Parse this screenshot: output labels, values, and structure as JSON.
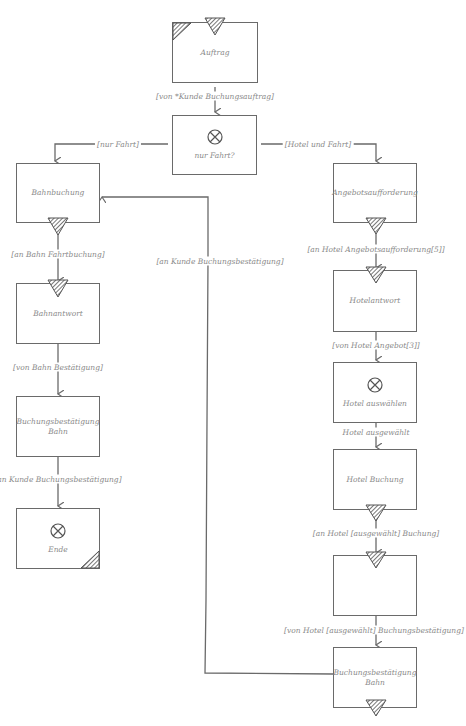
{
  "diagram": {
    "type": "process-flow",
    "nodes": [
      {
        "id": "auftrag",
        "label": "Auftrag",
        "start_event": true
      },
      {
        "id": "nur_fahrt",
        "label": "nur Fahrt?",
        "gateway": "xor"
      },
      {
        "id": "bahnbuchung",
        "label": "Bahnbuchung"
      },
      {
        "id": "bahnantwort",
        "label": "Bahnantwort"
      },
      {
        "id": "buchungsbestaetigung_bahn_left",
        "label": "Buchungsbestätigung Bahn"
      },
      {
        "id": "ende",
        "label": "Ende",
        "gateway": "xor",
        "end_event": true
      },
      {
        "id": "angebotsaufforderung",
        "label": "Angebotsaufforderung"
      },
      {
        "id": "hotelantwort",
        "label": "Hotelantwort"
      },
      {
        "id": "hotel_auswaehlen",
        "label": "Hotel auswählen",
        "gateway": "xor"
      },
      {
        "id": "hotel_buchung",
        "label": "Hotel Buchung"
      },
      {
        "id": "empty_box",
        "label": ""
      },
      {
        "id": "buchungsbestaetigung_bahn_right",
        "label": "Buchungsbestätigung Bahn"
      }
    ],
    "edges": [
      {
        "from": "auftrag",
        "to": "nur_fahrt",
        "label": "[von *Kunde Buchungsauftrag]"
      },
      {
        "from": "nur_fahrt",
        "to": "bahnbuchung",
        "label": "[nur Fahrt]"
      },
      {
        "from": "nur_fahrt",
        "to": "angebotsaufforderung",
        "label": "[Hotel und Fahrt]"
      },
      {
        "from": "bahnbuchung",
        "to": "bahnantwort",
        "label": "[an Bahn Fahrtbuchung]"
      },
      {
        "from": "bahnantwort",
        "to": "buchungsbestaetigung_bahn_left",
        "label": "[von Bahn Bestätigung]"
      },
      {
        "from": "buchungsbestaetigung_bahn_left",
        "to": "ende",
        "label": "[an Kunde Buchungsbestätigung]"
      },
      {
        "from": "angebotsaufforderung",
        "to": "hotelantwort",
        "label": "[an Hotel Angebotsaufforderung[5]]"
      },
      {
        "from": "hotelantwort",
        "to": "hotel_auswaehlen",
        "label": "[von Hotel Angebot[3]]"
      },
      {
        "from": "hotel_auswaehlen",
        "to": "hotel_buchung",
        "label": "Hotel ausgewählt"
      },
      {
        "from": "hotel_buchung",
        "to": "empty_box",
        "label": "[an Hotel [ausgewählt] Buchung]"
      },
      {
        "from": "empty_box",
        "to": "buchungsbestaetigung_bahn_right",
        "label": "[von Hotel [ausgewählt] Buchungsbestätigung]"
      },
      {
        "from": "buchungsbestaetigung_bahn_right",
        "to": "bahnbuchung",
        "label": "[an Kunde Buchungsbestätigung]"
      }
    ]
  },
  "colors": {
    "stroke": "#6a6a6a",
    "text": "#8a8a8a",
    "background": "#ffffff"
  }
}
